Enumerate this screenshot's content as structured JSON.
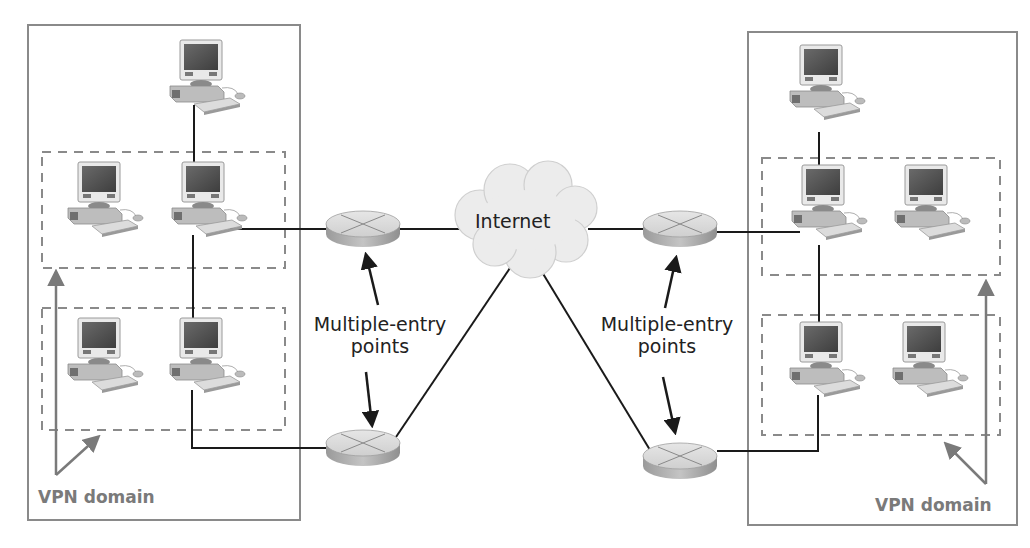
{
  "diagram": {
    "title": "",
    "cloud": {
      "label": "Internet"
    },
    "annotations": {
      "left_entry": {
        "line1": "Multiple-entry",
        "line2": "points"
      },
      "right_entry": {
        "line1": "Multiple-entry",
        "line2": "points"
      },
      "left_domain": "VPN domain",
      "right_domain": "VPN domain"
    },
    "colors": {
      "box_border": "#8a8a8a",
      "dashed_border": "#8a8a8a",
      "link_line": "#1a1a1a",
      "vpn_label": "#7a7a7a",
      "router_fill": "#d0d0d0",
      "cloud_fill": "#ececec"
    },
    "nodes": {
      "left_site": {
        "computers": 5,
        "routers": 2
      },
      "right_site": {
        "computers": 5,
        "routers": 2
      }
    }
  }
}
